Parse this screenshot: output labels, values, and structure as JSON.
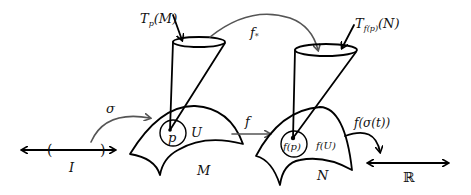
{
  "diagram": {
    "labels": {
      "tangent_M": "T",
      "tangent_M_sub": "p",
      "tangent_M_arg": "(M)",
      "tangent_N": "T",
      "tangent_N_sub": "f(p)",
      "tangent_N_arg": "(N)",
      "pushforward": "f",
      "pushforward_sub": "*",
      "sigma": "σ",
      "interval": "I",
      "interval_open": "(",
      "interval_close": ")",
      "point_p": "p",
      "neighborhood_U": "U",
      "manifold_M": "M",
      "map_f": "f",
      "point_fp": "f(p)",
      "image_fU": "f(U)",
      "manifold_N": "N",
      "composite": "f(σ(t))",
      "reals": "ℝ"
    },
    "colors": {
      "ink": "#000000",
      "arc": "#555555",
      "background": "#ffffff"
    }
  }
}
